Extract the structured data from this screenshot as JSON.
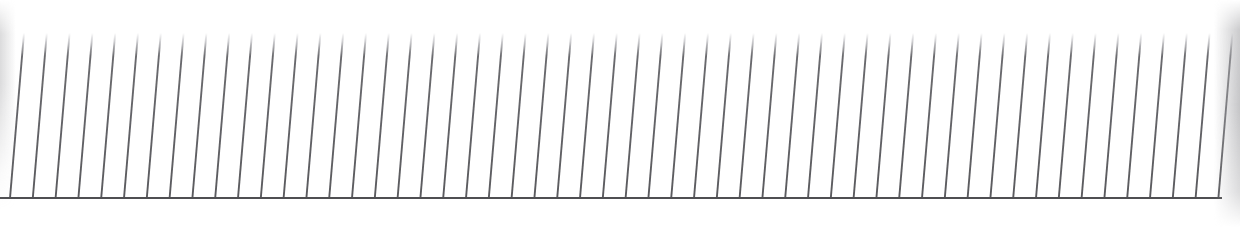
{
  "image": {
    "title": "Slanted vertical line grating above a horizontal baseline",
    "subject": "row of evenly spaced thin slanted strokes resting on a single horizontal rule",
    "width": 1240,
    "height": 247,
    "background_color": "#ffffff"
  },
  "chart_data": {
    "type": "line",
    "title": "",
    "xlabel": "",
    "ylabel": "",
    "grid": false,
    "legend_position": "none",
    "xlim": [
      0,
      1240
    ],
    "ylim": [
      0,
      247
    ],
    "baseline": {
      "name": "baseline-rule",
      "x_start": 0,
      "x_end": 1222,
      "y": 198,
      "thickness": 2,
      "color": "#4f4f52"
    },
    "strokes": {
      "name": "slanted-strokes",
      "count": 54,
      "first_bottom_x": 10,
      "spacing": 22.8,
      "slant_dx": 14,
      "top_y": 33,
      "bottom_y": 198,
      "thickness": 1.9,
      "color": "#6a6a6e",
      "top_fade_px": 6
    },
    "edges": [
      {
        "name": "left-edge-blur",
        "side": "left",
        "x": 0,
        "width": 16,
        "color": "#bebec0",
        "opacity": 0.55
      },
      {
        "name": "right-edge-blur",
        "side": "right",
        "x": 1214,
        "width": 26,
        "color": "#b2b2b5",
        "opacity": 0.75
      }
    ]
  }
}
